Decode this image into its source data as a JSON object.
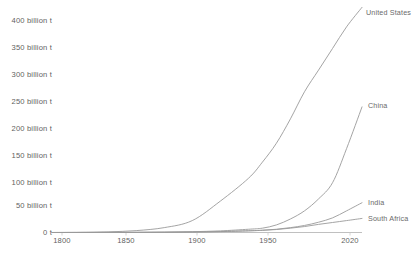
{
  "chart_data": {
    "type": "line",
    "title": "",
    "subtitle": "",
    "xlabel": "",
    "ylabel": "",
    "xlim": [
      1800,
      2021
    ],
    "ylim": [
      0,
      420
    ],
    "grid": false,
    "legend_position": "end-of-line labels",
    "y_tick_labels": [
      "400 billion t",
      "350 billion t",
      "300 billion t",
      "250 billion t",
      "200 billion t",
      "150 billion t",
      "100 billion t",
      "50 billion t",
      "0 t"
    ],
    "y_tick_values": [
      400,
      350,
      300,
      250,
      200,
      150,
      100,
      50,
      0
    ],
    "x_tick_labels": [
      "1800",
      "1850",
      "1900",
      "1950",
      "2020"
    ],
    "x_tick_values": [
      1800,
      1850,
      1900,
      1950,
      2020
    ],
    "x": [
      1800,
      1820,
      1840,
      1860,
      1880,
      1900,
      1920,
      1940,
      1950,
      1960,
      1970,
      1980,
      1990,
      2000,
      2010,
      2021
    ],
    "series": [
      {
        "name": "United States",
        "label": "United States",
        "color": "#9a9a9a",
        "values": [
          0,
          0.3,
          1.2,
          3.5,
          9,
          22,
          58,
          100,
          130,
          165,
          210,
          260,
          300,
          340,
          380,
          416
        ]
      },
      {
        "name": "China",
        "label": "China",
        "color": "#9a9a9a",
        "values": [
          0,
          0.1,
          0.2,
          0.4,
          0.8,
          1.5,
          3,
          6,
          8,
          14,
          25,
          40,
          62,
          92,
          155,
          232
        ]
      },
      {
        "name": "India",
        "label": "India",
        "color": "#9a9a9a",
        "values": [
          0,
          0.05,
          0.1,
          0.2,
          0.4,
          0.9,
          1.8,
          3.2,
          4.2,
          6,
          9,
          13,
          19,
          27,
          40,
          55
        ]
      },
      {
        "name": "South Africa",
        "label": "South Africa",
        "color": "#9a9a9a",
        "values": [
          0,
          0.02,
          0.05,
          0.1,
          0.3,
          0.8,
          1.6,
          3,
          4,
          5.5,
          8,
          11,
          15,
          18.5,
          22,
          26
        ]
      }
    ]
  },
  "axis": {
    "baseline_color": "#b9b9b9",
    "tick_color": "#c9c9c9",
    "label_color": "#5f5f5f"
  }
}
